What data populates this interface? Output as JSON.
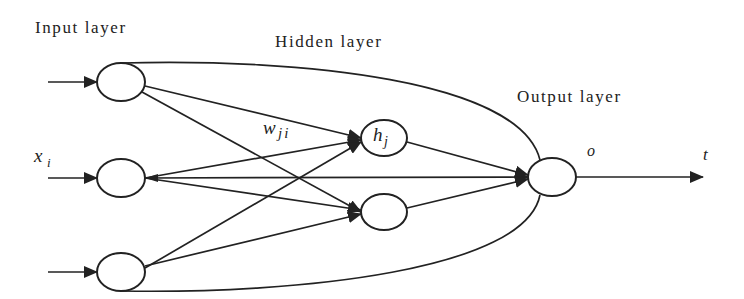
{
  "diagram": {
    "layers": {
      "input": {
        "label": "Input layer"
      },
      "hidden": {
        "label": "Hidden layer"
      },
      "output": {
        "label": "Output layer"
      }
    },
    "symbols": {
      "input_var": "x",
      "input_sub": "i",
      "weight_var": "w",
      "weight_sub": "ji",
      "hidden_var": "h",
      "hidden_sub": "j",
      "output_var": "o",
      "target_var": "t"
    },
    "nodes": [
      {
        "id": "in1",
        "layer": "input",
        "label": ""
      },
      {
        "id": "in2",
        "layer": "input",
        "label": ""
      },
      {
        "id": "in3",
        "layer": "input",
        "label": ""
      },
      {
        "id": "h1",
        "layer": "hidden",
        "label": "h_j"
      },
      {
        "id": "h2",
        "layer": "hidden",
        "label": ""
      },
      {
        "id": "out",
        "layer": "output",
        "label": ""
      }
    ],
    "edges": [
      {
        "from": "ext",
        "to": "in1"
      },
      {
        "from": "ext",
        "to": "in2"
      },
      {
        "from": "ext",
        "to": "in3"
      },
      {
        "from": "in1",
        "to": "h1",
        "label": "w_ji"
      },
      {
        "from": "in1",
        "to": "h2"
      },
      {
        "from": "in1",
        "to": "out",
        "shape": "curve"
      },
      {
        "from": "in2",
        "to": "h1"
      },
      {
        "from": "in2",
        "to": "h2"
      },
      {
        "from": "in2",
        "to": "out"
      },
      {
        "from": "in3",
        "to": "h1"
      },
      {
        "from": "in3",
        "to": "h2"
      },
      {
        "from": "in3",
        "to": "out",
        "shape": "curve"
      },
      {
        "from": "h1",
        "to": "out"
      },
      {
        "from": "h2",
        "to": "out"
      },
      {
        "from": "out",
        "to": "t",
        "label": "o"
      }
    ],
    "colors": {
      "stroke": "#222222",
      "background": "#ffffff"
    }
  }
}
